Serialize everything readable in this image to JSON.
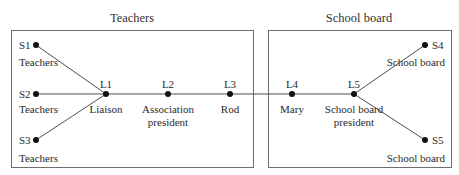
{
  "diagram": {
    "caption_cut_off": "",
    "groups": [
      {
        "id": "teachers",
        "title": "Teachers"
      },
      {
        "id": "school_board",
        "title": "School board"
      }
    ],
    "nodes": [
      {
        "id": "S1",
        "label": "S1",
        "role": "Teachers"
      },
      {
        "id": "S2",
        "label": "S2",
        "role": "Teachers"
      },
      {
        "id": "S3",
        "label": "S3",
        "role": "Teachers"
      },
      {
        "id": "L1",
        "label": "L1",
        "role": "Liaison"
      },
      {
        "id": "L2",
        "label": "L2",
        "role_line1": "Association",
        "role_line2": "president"
      },
      {
        "id": "L3",
        "label": "L3",
        "role": "Rod"
      },
      {
        "id": "L4",
        "label": "L4",
        "role": "Mary"
      },
      {
        "id": "L5",
        "label": "L5",
        "role_line1": "School board",
        "role_line2": "president"
      },
      {
        "id": "S4",
        "label": "S4",
        "role": "School board"
      },
      {
        "id": "S5",
        "label": "S5",
        "role": "School board"
      }
    ],
    "edges": [
      [
        "S1",
        "L1"
      ],
      [
        "S2",
        "L1"
      ],
      [
        "S3",
        "L1"
      ],
      [
        "L1",
        "L2"
      ],
      [
        "L2",
        "L3"
      ],
      [
        "L3",
        "L4"
      ],
      [
        "L4",
        "L5"
      ],
      [
        "L5",
        "S4"
      ],
      [
        "L5",
        "S5"
      ]
    ],
    "colors": {
      "line": "#3a3a3a",
      "box": "#6e6e6e",
      "dot": "#111111"
    }
  }
}
